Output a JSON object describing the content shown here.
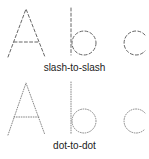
{
  "panels": [
    {
      "style": "slash-to-slash",
      "label": "slash-to-slash",
      "letters": [
        "A",
        "b",
        "c"
      ],
      "stroke_color": "#555555",
      "dash": "3,2.2"
    },
    {
      "style": "dot-to-dot",
      "label": "dot-to-dot",
      "letters": [
        "A",
        "b",
        "c"
      ],
      "stroke_color": "#777777",
      "dash": "0.8,1.6"
    }
  ]
}
